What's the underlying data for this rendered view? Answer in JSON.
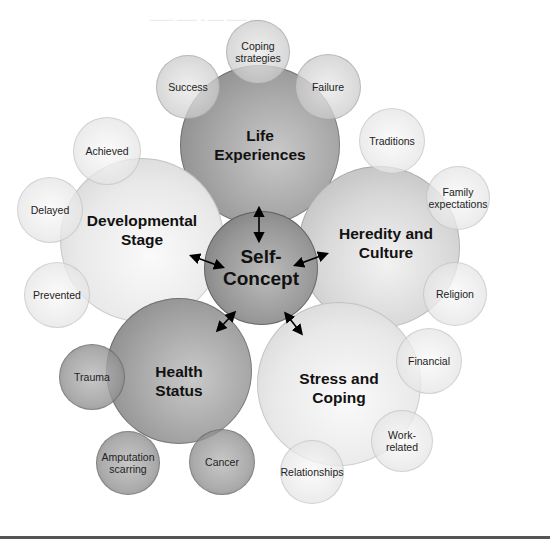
{
  "diagram": {
    "center": {
      "label_line1": "Self-",
      "label_line2": "Concept"
    },
    "major_factors": [
      {
        "id": "life-experiences",
        "line1": "Life",
        "line2": "Experiences"
      },
      {
        "id": "developmental-stage",
        "line1": "Developmental",
        "line2": "Stage"
      },
      {
        "id": "heredity-culture",
        "line1": "Heredity and",
        "line2": "Culture"
      },
      {
        "id": "health-status",
        "line1": "Health",
        "line2": "Status"
      },
      {
        "id": "stress-coping",
        "line1": "Stress and",
        "line2": "Coping"
      }
    ],
    "sub_factors": {
      "life_experiences": [
        {
          "line1": "Coping",
          "line2": "strategies"
        },
        {
          "line1": "Success",
          "line2": ""
        },
        {
          "line1": "Failure",
          "line2": ""
        }
      ],
      "heredity_culture": [
        {
          "line1": "Traditions",
          "line2": ""
        },
        {
          "line1": "Family",
          "line2": "expectations"
        },
        {
          "line1": "Religion",
          "line2": ""
        }
      ],
      "developmental_stage": [
        {
          "line1": "Achieved",
          "line2": ""
        },
        {
          "line1": "Delayed",
          "line2": ""
        },
        {
          "line1": "Prevented",
          "line2": ""
        }
      ],
      "health_status": [
        {
          "line1": "Trauma",
          "line2": ""
        },
        {
          "line1": "Amputation",
          "line2": "scarring"
        },
        {
          "line1": "Cancer",
          "line2": ""
        }
      ],
      "stress_coping": [
        {
          "line1": "Financial",
          "line2": ""
        },
        {
          "line1": "Work-",
          "line2": "related"
        },
        {
          "line1": "Relationships",
          "line2": ""
        }
      ]
    },
    "arrows": "bidirectional arrows between Self-Concept and each major factor"
  }
}
